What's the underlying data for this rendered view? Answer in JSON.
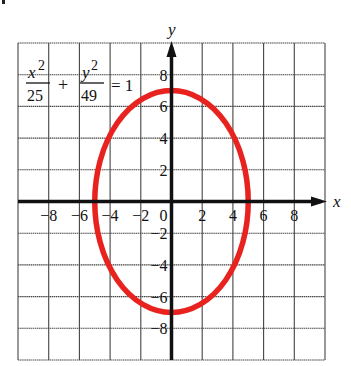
{
  "header": {
    "title_partial": "Grid 2"
  },
  "chart_data": {
    "type": "line",
    "title": "",
    "equation": {
      "x_num": "x",
      "x_exp": "2",
      "x_den": "25",
      "plus": "+",
      "y_num": "y",
      "y_exp": "2",
      "y_den": "49",
      "equals": "= 1"
    },
    "xlabel": "x",
    "ylabel": "y",
    "xlim": [
      -10,
      10
    ],
    "ylim": [
      -10,
      10
    ],
    "grid": true,
    "x_ticks": [
      -8,
      -6,
      -4,
      -2,
      0,
      2,
      4,
      6,
      8
    ],
    "y_ticks": [
      -8,
      -6,
      -4,
      -2,
      2,
      4,
      6,
      8
    ],
    "x_tick_labels": [
      "-8",
      "-6",
      "-4",
      "-2",
      "0",
      "2",
      "4",
      "6",
      "8"
    ],
    "y_tick_labels": [
      "8",
      "6",
      "4",
      "2",
      "-2",
      "-4",
      "-6",
      "-8"
    ],
    "series": [
      {
        "name": "ellipse x^2/25 + y^2/49 = 1",
        "shape": "ellipse",
        "center": [
          0,
          0
        ],
        "semi_axis_x": 5,
        "semi_axis_y": 7,
        "color": "#e8231f",
        "x": [
          5,
          3.54,
          0,
          -3.54,
          -5,
          -3.54,
          0,
          3.54,
          5
        ],
        "y": [
          0,
          4.95,
          7,
          4.95,
          0,
          -4.95,
          -7,
          -4.95,
          0
        ]
      }
    ]
  },
  "colors": {
    "curve": "#e8231f",
    "axis": "#111111",
    "grid": "#444444"
  }
}
